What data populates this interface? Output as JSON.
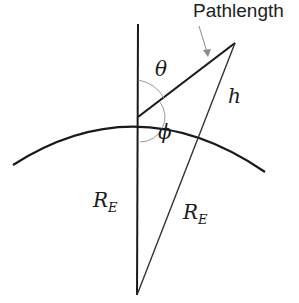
{
  "diagram": {
    "title_label": "Pathlength",
    "labels": {
      "theta": "θ",
      "phi": "ϕ",
      "h": "h",
      "radius_left": {
        "base": "R",
        "sub": "E"
      },
      "radius_right": {
        "base": "R",
        "sub": "E"
      }
    },
    "colors": {
      "line": "#1a1a1a",
      "thin_line": "#333333",
      "arc": "#9a9a9a",
      "arrow": "#8a8a8a"
    },
    "points": {
      "vertical_top": [
        138,
        24
      ],
      "surface_point": [
        138,
        117
      ],
      "earth_center": [
        137,
        295
      ],
      "satellite": [
        235,
        43
      ]
    }
  }
}
